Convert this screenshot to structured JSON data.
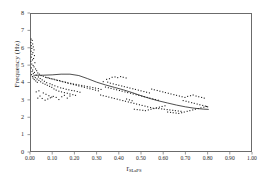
{
  "chart_data": {
    "type": "scatter",
    "title": "",
    "xlabel": "r",
    "xlabel_sub": "SLaPS",
    "ylabel": "Frequency (Hz)",
    "xlim": [
      0.0,
      1.0
    ],
    "ylim": [
      0,
      8
    ],
    "xticks": [
      "0.00",
      "0.10",
      "0.20",
      "0.30",
      "0.40",
      "0.50",
      "0.60",
      "0.70",
      "0.80",
      "0.90",
      "1.00"
    ],
    "xtick_values": [
      0.0,
      0.1,
      0.2,
      0.3,
      0.4,
      0.5,
      0.6,
      0.7,
      0.8,
      0.9,
      1.0
    ],
    "yticks": [
      "0",
      "1",
      "2",
      "3",
      "4",
      "5",
      "6",
      "7",
      "8"
    ],
    "ytick_values": [
      0,
      1,
      2,
      3,
      4,
      5,
      6,
      7,
      8
    ],
    "grid": false,
    "legend": "none",
    "marker": "dot",
    "marker_color": "#222222",
    "marker_size": 1.1,
    "line_color": "#222222",
    "frame_color": "#6b6b6b",
    "background": "#ffffff",
    "series": [
      {
        "name": "observations",
        "points": [
          [
            0.005,
            6.5
          ],
          [
            0.01,
            6.42
          ],
          [
            0.004,
            6.3
          ],
          [
            0.012,
            6.22
          ],
          [
            0.006,
            6.12
          ],
          [
            0.015,
            6.05
          ],
          [
            0.008,
            5.96
          ],
          [
            0.018,
            5.88
          ],
          [
            0.005,
            5.8
          ],
          [
            0.013,
            5.72
          ],
          [
            0.009,
            5.62
          ],
          [
            0.02,
            5.55
          ],
          [
            0.006,
            5.46
          ],
          [
            0.016,
            5.38
          ],
          [
            0.011,
            5.3
          ],
          [
            0.004,
            5.22
          ],
          [
            0.022,
            5.14
          ],
          [
            0.008,
            5.06
          ],
          [
            0.014,
            4.98
          ],
          [
            0.018,
            4.9
          ],
          [
            0.006,
            4.84
          ],
          [
            0.025,
            4.78
          ],
          [
            0.012,
            4.72
          ],
          [
            0.03,
            4.68
          ],
          [
            0.009,
            4.63
          ],
          [
            0.02,
            4.58
          ],
          [
            0.035,
            4.55
          ],
          [
            0.015,
            4.51
          ],
          [
            0.042,
            4.48
          ],
          [
            0.007,
            4.45
          ],
          [
            0.028,
            4.42
          ],
          [
            0.05,
            4.4
          ],
          [
            0.018,
            4.38
          ],
          [
            0.06,
            4.36
          ],
          [
            0.011,
            4.34
          ],
          [
            0.038,
            4.32
          ],
          [
            0.07,
            4.3
          ],
          [
            0.024,
            4.28
          ],
          [
            0.082,
            4.27
          ],
          [
            0.014,
            4.25
          ],
          [
            0.046,
            4.23
          ],
          [
            0.095,
            4.22
          ],
          [
            0.032,
            4.2
          ],
          [
            0.108,
            4.19
          ],
          [
            0.019,
            4.17
          ],
          [
            0.055,
            4.15
          ],
          [
            0.12,
            4.14
          ],
          [
            0.04,
            4.12
          ],
          [
            0.133,
            4.11
          ],
          [
            0.026,
            4.09
          ],
          [
            0.065,
            4.07
          ],
          [
            0.145,
            4.06
          ],
          [
            0.048,
            4.04
          ],
          [
            0.158,
            4.03
          ],
          [
            0.033,
            4.01
          ],
          [
            0.075,
            3.99
          ],
          [
            0.17,
            3.98
          ],
          [
            0.058,
            3.96
          ],
          [
            0.183,
            3.95
          ],
          [
            0.09,
            3.93
          ],
          [
            0.195,
            3.92
          ],
          [
            0.068,
            3.9
          ],
          [
            0.208,
            3.89
          ],
          [
            0.1,
            3.87
          ],
          [
            0.22,
            3.86
          ],
          [
            0.078,
            3.84
          ],
          [
            0.233,
            3.83
          ],
          [
            0.112,
            3.81
          ],
          [
            0.245,
            3.8
          ],
          [
            0.088,
            3.78
          ],
          [
            0.258,
            3.77
          ],
          [
            0.125,
            3.75
          ],
          [
            0.27,
            3.74
          ],
          [
            0.098,
            3.72
          ],
          [
            0.283,
            3.71
          ],
          [
            0.138,
            3.69
          ],
          [
            0.295,
            3.68
          ],
          [
            0.15,
            3.66
          ],
          [
            0.308,
            3.65
          ],
          [
            0.108,
            3.63
          ],
          [
            0.163,
            3.61
          ],
          [
            0.32,
            3.6
          ],
          [
            0.175,
            3.58
          ],
          [
            0.118,
            3.56
          ],
          [
            0.188,
            3.54
          ],
          [
            0.2,
            3.52
          ],
          [
            0.13,
            3.5
          ],
          [
            0.213,
            3.48
          ],
          [
            0.142,
            3.46
          ],
          [
            0.225,
            3.44
          ],
          [
            0.155,
            3.42
          ],
          [
            0.168,
            3.38
          ],
          [
            0.18,
            3.34
          ],
          [
            0.193,
            3.3
          ],
          [
            0.205,
            3.26
          ],
          [
            0.06,
            3.4
          ],
          [
            0.072,
            3.32
          ],
          [
            0.085,
            3.24
          ],
          [
            0.098,
            3.16
          ],
          [
            0.045,
            3.22
          ],
          [
            0.055,
            3.08
          ],
          [
            0.068,
            2.98
          ],
          [
            0.035,
            3.1
          ],
          [
            0.08,
            3.05
          ],
          [
            0.092,
            3.12
          ],
          [
            0.105,
            3.2
          ],
          [
            0.118,
            3.14
          ],
          [
            0.13,
            3.02
          ],
          [
            0.143,
            3.18
          ],
          [
            0.155,
            3.26
          ],
          [
            0.168,
            3.1
          ],
          [
            0.18,
            3.22
          ],
          [
            0.028,
            3.46
          ],
          [
            0.04,
            3.52
          ],
          [
            0.33,
            4.05
          ],
          [
            0.345,
            4.18
          ],
          [
            0.358,
            4.22
          ],
          [
            0.37,
            4.3
          ],
          [
            0.383,
            4.32
          ],
          [
            0.395,
            4.28
          ],
          [
            0.408,
            4.34
          ],
          [
            0.42,
            4.3
          ],
          [
            0.433,
            4.26
          ],
          [
            0.35,
            4.02
          ],
          [
            0.362,
            3.96
          ],
          [
            0.375,
            3.92
          ],
          [
            0.388,
            3.88
          ],
          [
            0.4,
            3.84
          ],
          [
            0.413,
            3.8
          ],
          [
            0.425,
            3.76
          ],
          [
            0.438,
            3.72
          ],
          [
            0.45,
            3.68
          ],
          [
            0.463,
            3.64
          ],
          [
            0.475,
            3.6
          ],
          [
            0.488,
            3.56
          ],
          [
            0.5,
            3.52
          ],
          [
            0.513,
            3.48
          ],
          [
            0.525,
            3.44
          ],
          [
            0.538,
            3.4
          ],
          [
            0.34,
            3.74
          ],
          [
            0.353,
            3.7
          ],
          [
            0.365,
            3.66
          ],
          [
            0.378,
            3.62
          ],
          [
            0.39,
            3.58
          ],
          [
            0.403,
            3.54
          ],
          [
            0.415,
            3.5
          ],
          [
            0.428,
            3.46
          ],
          [
            0.44,
            3.42
          ],
          [
            0.453,
            3.38
          ],
          [
            0.465,
            3.34
          ],
          [
            0.478,
            3.3
          ],
          [
            0.49,
            3.26
          ],
          [
            0.503,
            3.22
          ],
          [
            0.515,
            3.18
          ],
          [
            0.528,
            3.14
          ],
          [
            0.54,
            3.1
          ],
          [
            0.553,
            3.06
          ],
          [
            0.565,
            3.02
          ],
          [
            0.578,
            2.98
          ],
          [
            0.318,
            3.28
          ],
          [
            0.33,
            3.24
          ],
          [
            0.343,
            3.2
          ],
          [
            0.355,
            3.16
          ],
          [
            0.368,
            3.12
          ],
          [
            0.38,
            3.08
          ],
          [
            0.393,
            3.04
          ],
          [
            0.405,
            3.0
          ],
          [
            0.418,
            2.96
          ],
          [
            0.43,
            2.92
          ],
          [
            0.443,
            2.88
          ],
          [
            0.455,
            2.84
          ],
          [
            0.468,
            2.8
          ],
          [
            0.48,
            2.76
          ],
          [
            0.493,
            2.72
          ],
          [
            0.505,
            2.68
          ],
          [
            0.518,
            2.64
          ],
          [
            0.53,
            2.6
          ],
          [
            0.543,
            2.56
          ],
          [
            0.555,
            2.52
          ],
          [
            0.568,
            2.52
          ],
          [
            0.58,
            2.5
          ],
          [
            0.593,
            2.48
          ],
          [
            0.605,
            2.46
          ],
          [
            0.618,
            2.44
          ],
          [
            0.63,
            2.42
          ],
          [
            0.643,
            2.4
          ],
          [
            0.655,
            2.38
          ],
          [
            0.668,
            2.36
          ],
          [
            0.68,
            2.34
          ],
          [
            0.548,
            3.62
          ],
          [
            0.56,
            3.58
          ],
          [
            0.573,
            3.54
          ],
          [
            0.585,
            3.5
          ],
          [
            0.598,
            3.46
          ],
          [
            0.61,
            3.42
          ],
          [
            0.623,
            3.38
          ],
          [
            0.635,
            3.34
          ],
          [
            0.648,
            3.3
          ],
          [
            0.66,
            3.26
          ],
          [
            0.673,
            3.22
          ],
          [
            0.685,
            3.18
          ],
          [
            0.698,
            3.14
          ],
          [
            0.71,
            3.2
          ],
          [
            0.723,
            3.24
          ],
          [
            0.735,
            3.28
          ],
          [
            0.748,
            3.22
          ],
          [
            0.76,
            3.18
          ],
          [
            0.773,
            3.14
          ],
          [
            0.785,
            3.1
          ],
          [
            0.69,
            2.96
          ],
          [
            0.703,
            2.92
          ],
          [
            0.715,
            2.88
          ],
          [
            0.728,
            2.84
          ],
          [
            0.74,
            2.8
          ],
          [
            0.753,
            2.76
          ],
          [
            0.765,
            2.72
          ],
          [
            0.778,
            2.68
          ],
          [
            0.79,
            2.64
          ],
          [
            0.8,
            2.6
          ],
          [
            0.62,
            2.3
          ],
          [
            0.633,
            2.28
          ],
          [
            0.645,
            2.26
          ],
          [
            0.658,
            2.24
          ],
          [
            0.67,
            2.22
          ],
          [
            0.683,
            2.26
          ],
          [
            0.695,
            2.3
          ],
          [
            0.708,
            2.34
          ],
          [
            0.72,
            2.38
          ],
          [
            0.733,
            2.42
          ],
          [
            0.745,
            2.46
          ],
          [
            0.758,
            2.5
          ],
          [
            0.77,
            2.54
          ],
          [
            0.783,
            2.58
          ],
          [
            0.795,
            2.62
          ],
          [
            0.47,
            2.46
          ],
          [
            0.483,
            2.44
          ],
          [
            0.495,
            2.42
          ],
          [
            0.508,
            2.4
          ],
          [
            0.52,
            2.38
          ],
          [
            0.533,
            2.42
          ],
          [
            0.545,
            2.46
          ],
          [
            0.558,
            2.5
          ],
          [
            0.57,
            2.54
          ],
          [
            0.583,
            2.58
          ],
          [
            0.595,
            2.62
          ],
          [
            0.608,
            2.66
          ],
          [
            0.435,
            3.05
          ],
          [
            0.448,
            3.0
          ],
          [
            0.46,
            2.95
          ],
          [
            0.308,
            3.52
          ],
          [
            0.295,
            3.56
          ],
          [
            0.283,
            3.6
          ],
          [
            0.27,
            3.64
          ],
          [
            0.258,
            3.68
          ],
          [
            0.245,
            3.72
          ],
          [
            0.233,
            3.76
          ],
          [
            0.22,
            3.8
          ],
          [
            0.208,
            3.84
          ],
          [
            0.196,
            3.88
          ],
          [
            0.184,
            3.92
          ],
          [
            0.172,
            3.96
          ],
          [
            0.16,
            4.0
          ],
          [
            0.148,
            4.04
          ],
          [
            0.136,
            4.08
          ],
          [
            0.124,
            4.12
          ],
          [
            0.112,
            4.16
          ],
          [
            0.1,
            4.2
          ],
          [
            0.088,
            4.24
          ],
          [
            0.076,
            4.28
          ]
        ]
      }
    ],
    "fit_curve": {
      "name": "trend",
      "points": [
        [
          0.02,
          4.42
        ],
        [
          0.06,
          4.42
        ],
        [
          0.1,
          4.44
        ],
        [
          0.14,
          4.48
        ],
        [
          0.18,
          4.48
        ],
        [
          0.22,
          4.4
        ],
        [
          0.26,
          4.22
        ],
        [
          0.3,
          4.02
        ],
        [
          0.34,
          3.86
        ],
        [
          0.38,
          3.72
        ],
        [
          0.42,
          3.58
        ],
        [
          0.46,
          3.42
        ],
        [
          0.5,
          3.24
        ],
        [
          0.54,
          3.08
        ],
        [
          0.58,
          2.94
        ],
        [
          0.62,
          2.82
        ],
        [
          0.66,
          2.7
        ],
        [
          0.7,
          2.6
        ],
        [
          0.74,
          2.52
        ],
        [
          0.78,
          2.47
        ],
        [
          0.805,
          2.45
        ]
      ]
    }
  }
}
